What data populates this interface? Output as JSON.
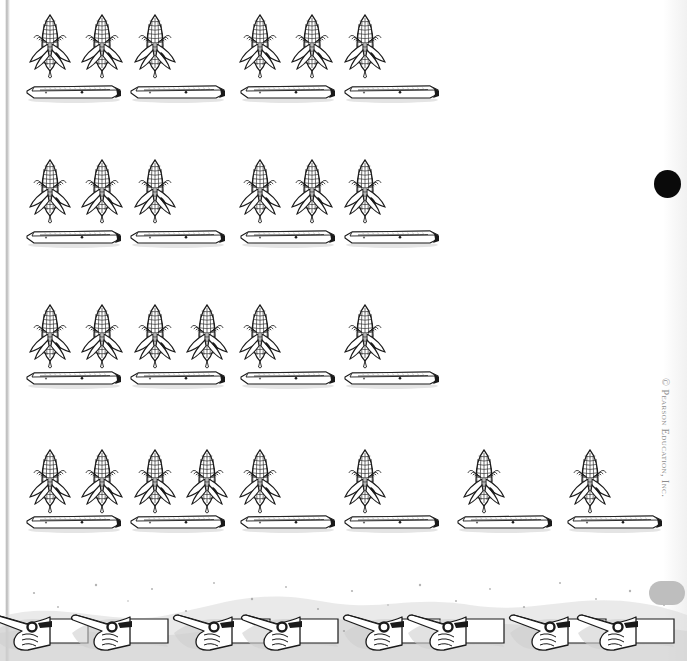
{
  "page": {
    "width": 687,
    "height": 661,
    "background_color": "#ffffff",
    "ink_color": "#1a1a1a",
    "shadow_color": "#c9c9c9"
  },
  "copyright": {
    "text": "© Pearson Education, Inc.",
    "color": "#8d8d8d",
    "rotation_degrees": 90
  },
  "markers": {
    "registration_dot": {
      "name": "black-dot",
      "color": "#0a0a0a",
      "x": 654,
      "y": 170,
      "diameter": 27
    },
    "binding_edge": {
      "name": "scan-binding-line",
      "color": "#aaaaaa",
      "x": 5,
      "width": 5
    },
    "gray_blob": {
      "name": "gray-blob",
      "color": "#b9b9b9"
    }
  },
  "icons": {
    "corn": "corn-cob-icon",
    "tray": "tray-icon",
    "hand": "pointing-hand-icon"
  },
  "rows": [
    {
      "label": "row-1",
      "top": 12,
      "tray_top": 82,
      "corn_count": 6,
      "tray_count": 4,
      "corn_x": [
        28,
        80,
        133,
        238,
        290,
        343
      ],
      "tray_x": [
        24,
        128,
        238,
        342
      ]
    },
    {
      "label": "row-2",
      "top": 157,
      "tray_top": 227,
      "corn_count": 6,
      "tray_count": 4,
      "corn_x": [
        28,
        80,
        133,
        238,
        290,
        343
      ],
      "tray_x": [
        24,
        128,
        238,
        342
      ]
    },
    {
      "label": "row-3",
      "top": 302,
      "tray_top": 368,
      "corn_count": 6,
      "tray_count": 4,
      "corn_x": [
        28,
        80,
        133,
        185,
        238,
        343
      ],
      "tray_x": [
        24,
        128,
        238,
        342
      ]
    },
    {
      "label": "row-4",
      "top": 447,
      "tray_top": 512,
      "corn_count": 8,
      "tray_count": 6,
      "corn_x": [
        28,
        80,
        133,
        185,
        238,
        343,
        462,
        568
      ],
      "tray_x": [
        24,
        128,
        238,
        342,
        455,
        565
      ]
    }
  ],
  "hand_border": {
    "label": "decorative-hand-border",
    "hand_count": 8,
    "hand_x": [
      -12,
      68,
      170,
      238,
      340,
      404,
      506,
      574
    ]
  }
}
